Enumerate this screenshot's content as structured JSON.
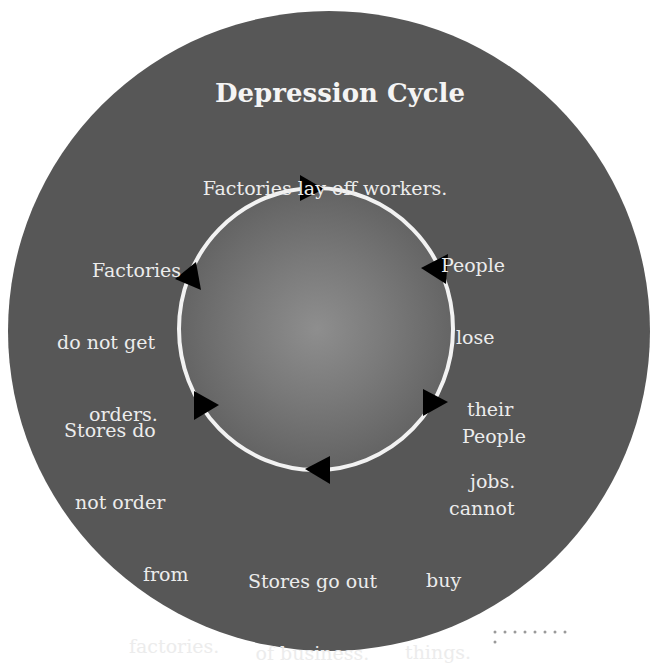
{
  "diagram": {
    "title": "Depression Cycle",
    "type": "cycle",
    "direction": "clockwise",
    "colors": {
      "outer_disc": "#575757",
      "inner_disc_center": "#8e8e8e",
      "ring": "#f2f2f2",
      "arrow": "#000000",
      "text": "#ececec"
    },
    "steps": [
      {
        "id": "step1",
        "lines": [
          "Factories lay off workers."
        ]
      },
      {
        "id": "step2",
        "lines": [
          "People",
          "lose",
          "their",
          "jobs."
        ]
      },
      {
        "id": "step3",
        "lines": [
          "People",
          "cannot",
          "buy",
          "things."
        ]
      },
      {
        "id": "step4",
        "lines": [
          "Stores go out",
          "of business."
        ]
      },
      {
        "id": "step5",
        "lines": [
          "Stores do",
          "not order",
          "from",
          "factories."
        ]
      },
      {
        "id": "step6",
        "lines": [
          "Factories",
          "do not get",
          "orders."
        ]
      }
    ]
  }
}
